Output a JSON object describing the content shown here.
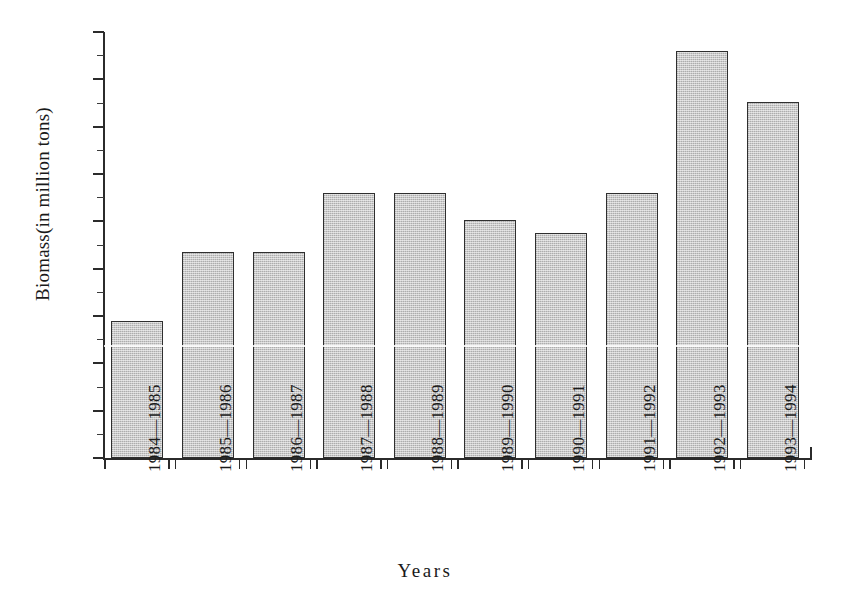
{
  "chart_data": {
    "type": "bar",
    "title": "",
    "xlabel": "Years",
    "ylabel": "Biomass(in million tons)",
    "categories": [
      "1984—1985",
      "1985—1986",
      "1986—1987",
      "1987—1988",
      "1988—1989",
      "1989—1990",
      "1990—1991",
      "1991—1992",
      "1992—1993",
      "1993—1994"
    ],
    "values": [
      1.45,
      2.18,
      2.18,
      2.8,
      2.8,
      2.51,
      2.38,
      2.8,
      4.3,
      3.76
    ],
    "ylim": [
      0.0,
      4.5
    ],
    "ytick_labels": [
      "0.0",
      "0.5",
      "1.0",
      "1.5",
      "2.0",
      "2.5",
      "3.0",
      "3.5",
      "4.0",
      "4.5"
    ],
    "ytick_values": [
      0.0,
      0.5,
      1.0,
      1.5,
      2.0,
      2.5,
      3.0,
      3.5,
      4.0,
      4.5
    ],
    "grid": false,
    "legend": null,
    "bar_color": "#c9c9c9",
    "bar_edge_color": "#2f2f2f",
    "axis_color": "#2b2b2b",
    "background": "#ffffff"
  }
}
